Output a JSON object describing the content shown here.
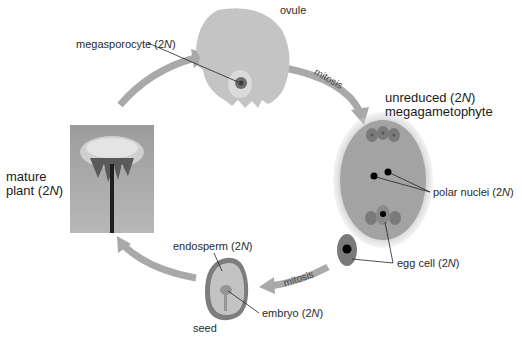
{
  "diagram": {
    "stages": {
      "ovule": {
        "label": "ovule"
      },
      "megasporocyte": {
        "label_text": "megasporocyte (2",
        "label_italic": "N",
        "label_end": ")"
      },
      "megagametophyte": {
        "line1_text": "unreduced (2",
        "line1_italic": "N",
        "line1_end": ")",
        "line2": "megagametophyte"
      },
      "polar_nuclei": {
        "label_text": "polar nuclei (2",
        "label_italic": "N",
        "label_end": ")"
      },
      "egg_cell": {
        "label_text": "egg cell (2",
        "label_italic": "N",
        "label_end": ")"
      },
      "endosperm": {
        "label_text": "endosperm (2",
        "label_italic": "N",
        "label_end": ")"
      },
      "embryo": {
        "label_text": "embryo (2",
        "label_italic": "N",
        "label_end": ")"
      },
      "seed": {
        "label": "seed"
      },
      "mature_plant": {
        "line1": "mature",
        "line2_text": "plant (2",
        "line2_italic": "N",
        "line2_end": ")"
      }
    },
    "arrows": {
      "ovule_to_megagametophyte": {
        "label": "mitosis"
      },
      "egg_to_seed": {
        "label": "mitosis"
      }
    },
    "colors": {
      "arrow": "#a9a9a9",
      "tissue_light": "#c2c2c2",
      "tissue_mid": "#9e9e9e",
      "tissue_dark": "#6f6f6f",
      "nucleus": "#000000",
      "photo_bg": "#a8a8a8"
    }
  }
}
